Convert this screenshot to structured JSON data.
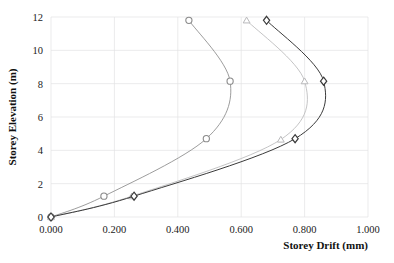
{
  "chart_data": {
    "type": "line",
    "title": "",
    "xlabel": "Storey Drift (mm)",
    "ylabel": "Storey Elevation (m)",
    "xlim": [
      0.0,
      1.0
    ],
    "ylim": [
      0,
      12
    ],
    "xticks": [
      "0.000",
      "0.200",
      "0.400",
      "0.600",
      "0.800",
      "1.000"
    ],
    "xtick_values": [
      0.0,
      0.2,
      0.4,
      0.6,
      0.8,
      1.0
    ],
    "yticks": [
      "0",
      "2",
      "4",
      "6",
      "8",
      "10",
      "12"
    ],
    "ytick_values": [
      0,
      2,
      4,
      6,
      8,
      10,
      12
    ],
    "grid": true,
    "legend": "none",
    "orientation": "x-is-drift, y-is-elevation",
    "series": [
      {
        "name": "Series 1",
        "marker": "circle",
        "color": "#8a8a8a",
        "x": [
          0.0,
          0.167,
          0.49,
          0.565,
          0.435
        ],
        "y": [
          0.0,
          1.25,
          4.7,
          8.15,
          11.8
        ]
      },
      {
        "name": "Series 2",
        "marker": "triangle",
        "color": "#b9b9bb",
        "x": [
          0.0,
          0.255,
          0.725,
          0.8,
          0.617
        ],
        "y": [
          0.0,
          1.25,
          4.65,
          8.15,
          11.8
        ]
      },
      {
        "name": "Series 3",
        "marker": "diamond",
        "color": "#3a3a3a",
        "x": [
          0.0,
          0.262,
          0.77,
          0.86,
          0.68
        ],
        "y": [
          0.0,
          1.25,
          4.7,
          8.15,
          11.8
        ]
      }
    ]
  }
}
